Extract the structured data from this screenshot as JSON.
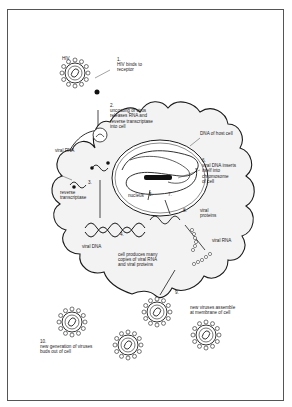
{
  "figure": {
    "colors": {
      "line": "#1a1a1a",
      "cell_fill": "#f3f3f3",
      "frame": "#555555",
      "background": "#ffffff"
    }
  },
  "labels": {
    "hiv": "HIV",
    "step1": "1.\nHIV binds to\nreceptor",
    "step2": "2.\nuncoating of virus\nreleases RNA and\nreverse transcriptase\ninto cell",
    "dna_host": "DNA of host cell",
    "step6": "6.\nviral DNA inserts\nitself into\nchromosome\nof cell",
    "viral_rna_left": "viral RNA",
    "step3": "3.",
    "reverse_transcriptase": "reverse\ntranscriptase",
    "step5": "5.",
    "nucleus": "nucleus",
    "step7": "7.",
    "step8": "8.",
    "viral_proteins": "viral\nproteins",
    "viral_rna_right": "viral RNA",
    "step4": "4.",
    "viral_dna": "viral DNA",
    "cell_produces": "cell produces many\ncopies of viral RNA\nand viral proteins",
    "step9": "9.",
    "new_viruses_assemble": "new viruses assemble\nat membrane of cell",
    "step10": "10.\nnew generation of viruses\nbuds out of cell"
  }
}
